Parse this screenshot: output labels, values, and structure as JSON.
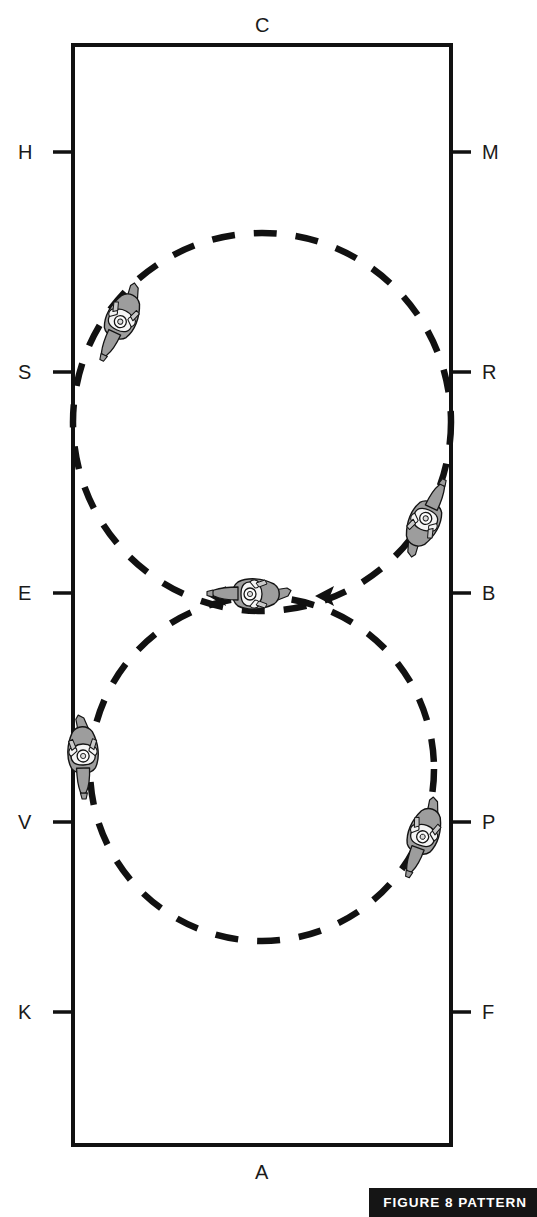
{
  "figure": {
    "caption": "FIGURE 8 PATTERN",
    "arena": {
      "shape": "rectangle",
      "outline_color": "#111111",
      "x": 73,
      "y": 45,
      "width": 378,
      "height": 1100
    },
    "letters": [
      {
        "id": "C",
        "label": "C",
        "side": "top",
        "x": 262,
        "y": 25,
        "tick": false
      },
      {
        "id": "A",
        "label": "A",
        "side": "bottom",
        "x": 262,
        "y": 1172,
        "tick": false
      },
      {
        "id": "H",
        "label": "H",
        "side": "left",
        "x": 27,
        "y": 152,
        "tick": true
      },
      {
        "id": "S",
        "label": "S",
        "side": "left",
        "x": 27,
        "y": 372,
        "tick": true
      },
      {
        "id": "E",
        "label": "E",
        "side": "left",
        "x": 27,
        "y": 593,
        "tick": true
      },
      {
        "id": "V",
        "label": "V",
        "side": "left",
        "x": 27,
        "y": 822,
        "tick": true
      },
      {
        "id": "K",
        "label": "K",
        "side": "left",
        "x": 27,
        "y": 1012,
        "tick": true
      },
      {
        "id": "M",
        "label": "M",
        "side": "right",
        "x": 489,
        "y": 152,
        "tick": true
      },
      {
        "id": "R",
        "label": "R",
        "side": "right",
        "x": 489,
        "y": 372,
        "tick": true
      },
      {
        "id": "B",
        "label": "B",
        "side": "right",
        "x": 489,
        "y": 593,
        "tick": true
      },
      {
        "id": "P",
        "label": "P",
        "side": "right",
        "x": 489,
        "y": 822,
        "tick": true
      },
      {
        "id": "F",
        "label": "F",
        "side": "right",
        "x": 489,
        "y": 1012,
        "tick": true
      }
    ],
    "path": {
      "style": "dashed",
      "color": "#111111",
      "stroke_width": 6,
      "dash": "22 18",
      "circles": [
        {
          "name": "upper-circle",
          "cx": 262,
          "cy": 422,
          "r": 189
        },
        {
          "name": "lower-circle",
          "cx": 262,
          "cy": 769,
          "r": 172
        }
      ],
      "crossing_point": {
        "name": "X",
        "x": 262,
        "y": 596
      }
    },
    "riders": [
      {
        "id": "rider-upper-left",
        "x": 122,
        "y": 318,
        "rotation": 205,
        "direction": "upper-circle"
      },
      {
        "id": "rider-upper-right",
        "x": 424,
        "y": 522,
        "rotation": 25,
        "direction": "upper-circle"
      },
      {
        "id": "rider-center",
        "x": 254,
        "y": 594,
        "rotation": 270,
        "direction": "crossing"
      },
      {
        "id": "rider-lower-left",
        "x": 83,
        "y": 752,
        "rotation": 178,
        "direction": "lower-circle"
      },
      {
        "id": "rider-lower-right",
        "x": 424,
        "y": 833,
        "rotation": 200,
        "direction": "lower-circle"
      }
    ],
    "colors": {
      "ink": "#111111",
      "horse_fill": "#9d9d9d",
      "rider_fill": "#f2f2f2",
      "banner_bg": "#151515",
      "banner_text": "#ffffff",
      "background": "#ffffff"
    }
  }
}
